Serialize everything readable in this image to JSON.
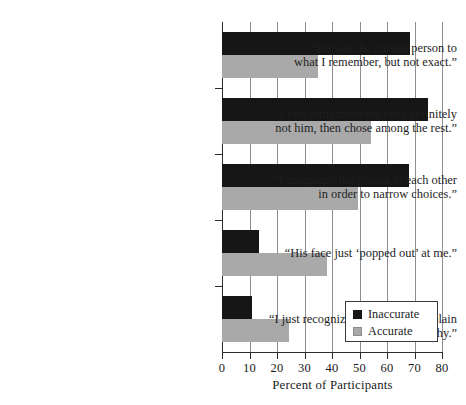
{
  "chart_data": {
    "type": "bar",
    "orientation": "horizontal",
    "title": "",
    "xlabel": "Percent of Participants",
    "ylabel": "",
    "xlim": [
      0,
      80
    ],
    "xticks": [
      0,
      10,
      20,
      30,
      40,
      50,
      60,
      70,
      80
    ],
    "grid": "vertical",
    "legend_position": "bottom-right",
    "categories": [
      "“He was the closest person to what I remember, but not exact.”",
      "“I first eliminated the ones definitely not him, then chose among the rest.”",
      "“I compared the photos to each other in order to narrow choices.”",
      "“His face just ‘popped out’ at me.”",
      "“I just recognized him. I can’t explain why.”"
    ],
    "category_lines": [
      [
        "“He was the closest person to",
        "what I remember, but not exact.”"
      ],
      [
        "“I first eliminated the ones definitely",
        "not him, then chose among the rest.”"
      ],
      [
        "“I compared the photos to each other",
        "in order to narrow choices.”"
      ],
      [
        "“His face just ‘popped out’ at me.”"
      ],
      [
        "“I just recognized him. I can’t explain why.”"
      ]
    ],
    "series": [
      {
        "name": "Inaccurate",
        "color": "#161616",
        "values": [
          68.5,
          75.0,
          68.0,
          13.5,
          11.0
        ]
      },
      {
        "name": "Accurate",
        "color": "#a9a9a9",
        "values": [
          35.0,
          54.0,
          49.5,
          38.0,
          24.5
        ]
      }
    ]
  },
  "legend": {
    "items": [
      {
        "label": "Inaccurate",
        "color": "#161616"
      },
      {
        "label": "Accurate",
        "color": "#a9a9a9"
      }
    ]
  },
  "axis": {
    "x_title": "Percent of Participants",
    "tick_labels": [
      "0",
      "10",
      "20",
      "30",
      "40",
      "50",
      "60",
      "70",
      "80"
    ]
  }
}
